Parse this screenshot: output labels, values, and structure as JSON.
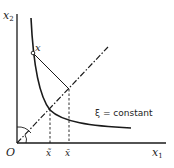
{
  "diagram": {
    "axes": {
      "x_label": "x",
      "x_subscript": "1",
      "y_label": "x",
      "y_subscript": "2",
      "origin_label": "O"
    },
    "point_label": "x",
    "curve_label": "ξ = constant",
    "tick_labels": {
      "tilde": "x̃",
      "bar": "x̄"
    },
    "colors": {
      "line": "#1a1a1a",
      "background": "#ffffff"
    }
  }
}
